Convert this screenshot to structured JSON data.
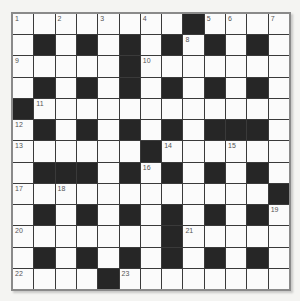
{
  "puzzle": {
    "rows": 13,
    "cols": 13,
    "colors": {
      "white": "#fbfbfb",
      "black": "#262626",
      "gridline": "#3a3a3a",
      "border": "#8a8a8a",
      "number": "#555555"
    },
    "layout": [
      "WWWWWWWWBWWWW",
      "WBWBWBWBWBWBW",
      "WWWWWBWWWWWWW",
      "WBWBWBWBWBWBW",
      "BWWWWWWWWWWWW",
      "WBWBWBWBWBBBW",
      "WWWWWWBWWWWWW",
      "WBBBWBWBWBWBW",
      "WWWWWWWWWWWWB",
      "WBWBWBWBWBWBW",
      "WWWWWWWBWWWWW",
      "WBWBWBWBWBWBW",
      "WWWWBWWWWWWWW"
    ],
    "numbers": [
      {
        "row": 0,
        "col": 0,
        "n": "1"
      },
      {
        "row": 0,
        "col": 2,
        "n": "2"
      },
      {
        "row": 0,
        "col": 4,
        "n": "3"
      },
      {
        "row": 0,
        "col": 6,
        "n": "4"
      },
      {
        "row": 0,
        "col": 9,
        "n": "5"
      },
      {
        "row": 0,
        "col": 10,
        "n": "6"
      },
      {
        "row": 0,
        "col": 12,
        "n": "7"
      },
      {
        "row": 1,
        "col": 8,
        "n": "8"
      },
      {
        "row": 2,
        "col": 0,
        "n": "9"
      },
      {
        "row": 2,
        "col": 6,
        "n": "10"
      },
      {
        "row": 4,
        "col": 1,
        "n": "11"
      },
      {
        "row": 5,
        "col": 0,
        "n": "12"
      },
      {
        "row": 6,
        "col": 0,
        "n": "13"
      },
      {
        "row": 6,
        "col": 7,
        "n": "14"
      },
      {
        "row": 6,
        "col": 10,
        "n": "15"
      },
      {
        "row": 7,
        "col": 6,
        "n": "16"
      },
      {
        "row": 8,
        "col": 0,
        "n": "17"
      },
      {
        "row": 8,
        "col": 2,
        "n": "18"
      },
      {
        "row": 9,
        "col": 12,
        "n": "19"
      },
      {
        "row": 10,
        "col": 0,
        "n": "20"
      },
      {
        "row": 10,
        "col": 8,
        "n": "21"
      },
      {
        "row": 12,
        "col": 0,
        "n": "22"
      },
      {
        "row": 12,
        "col": 5,
        "n": "23"
      }
    ]
  }
}
